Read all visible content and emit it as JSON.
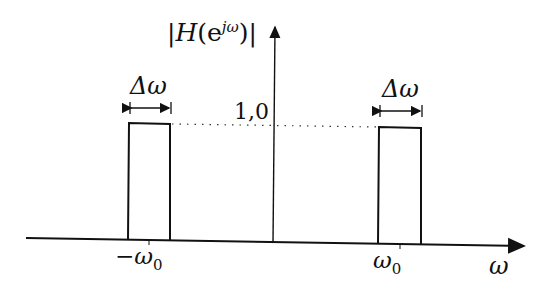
{
  "diagram": {
    "type": "frequency-response",
    "y_axis_label": "|H(e^{jω})|",
    "y_label_parts": {
      "bar_left": "|",
      "H": "H",
      "paren_open": "(e",
      "sup": "jω",
      "paren_close": ")",
      "bar_right": "|"
    },
    "x_axis_label": "ω",
    "level_label": "1,0",
    "bandwidth_label": "Δω",
    "left_band_center_label": "−ω",
    "right_band_center_label": "ω",
    "subscript": "0",
    "bands": [
      {
        "center": "-ω0",
        "height": 1.0,
        "width": "Δω"
      },
      {
        "center": "ω0",
        "height": 1.0,
        "width": "Δω"
      }
    ],
    "colors": {
      "line": "#111111",
      "background": "#ffffff"
    }
  }
}
